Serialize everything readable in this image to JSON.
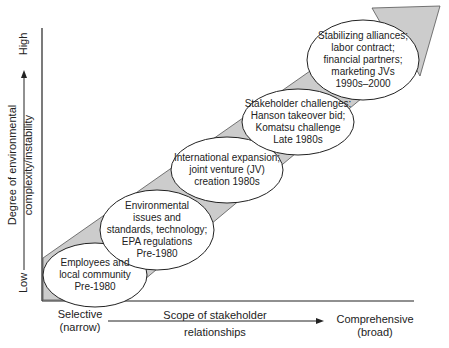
{
  "diagram": {
    "y_axis": {
      "title_line1": "Degree of environmental",
      "title_line2": "complexity/instability",
      "low_label": "Low",
      "high_label": "High"
    },
    "x_axis": {
      "title_line1": "Scope of stakeholder",
      "title_line2": "relationships",
      "left_label_line1": "Selective",
      "left_label_line2": "(narrow)",
      "right_label_line1": "Comprehensive",
      "right_label_line2": "(broad)"
    },
    "stages": [
      {
        "lines": [
          "Employees and",
          "local community",
          "Pre-1980"
        ]
      },
      {
        "lines": [
          "Environmental",
          "issues and",
          "standards, technology;",
          "EPA regulations",
          "Pre-1980"
        ]
      },
      {
        "lines": [
          "International expansion;",
          "joint venture (JV)",
          "creation 1980s"
        ]
      },
      {
        "lines": [
          "Stakeholder challenges:",
          "Hanson takeover bid;",
          "Komatsu challenge",
          "Late 1980s"
        ]
      },
      {
        "lines": [
          "Stabilizing alliances;",
          "labor contract;",
          "financial partners;",
          "marketing JVs",
          "1990s–2000"
        ]
      }
    ],
    "colors": {
      "arrow_fill": "#cccccc",
      "stroke": "#222222",
      "ellipse_fill": "#ffffff"
    }
  }
}
